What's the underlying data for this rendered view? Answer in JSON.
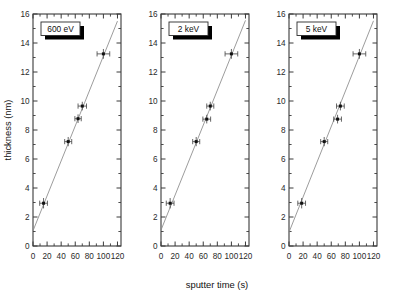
{
  "figure": {
    "xlabel": "sputter time (s)",
    "ylabel": "thickness (nm)",
    "background": "#ffffff",
    "line_color": "#8a8a8a",
    "marker_color": "#111111",
    "axis_color": "#3a3a3a"
  },
  "chart_data": {
    "type": "scatter",
    "title": "",
    "xlabel": "sputter time (s)",
    "ylabel": "thickness (nm)",
    "xlim": [
      0,
      125
    ],
    "ylim": [
      0,
      16
    ],
    "xticks": [
      0,
      20,
      40,
      60,
      80,
      100,
      120
    ],
    "yticks": [
      0,
      2,
      4,
      6,
      8,
      10,
      12,
      14,
      16
    ],
    "xtick_labels": [
      "0",
      "20",
      "40",
      "60",
      "80",
      "100",
      "120"
    ],
    "ytick_labels": [
      "0",
      "2",
      "4",
      "6",
      "8",
      "10",
      "12",
      "14",
      "16"
    ],
    "grid": false,
    "legend": "none",
    "panels": [
      {
        "label": "600 eV",
        "x": [
          15,
          50,
          64,
          70,
          100
        ],
        "y": [
          2.95,
          7.2,
          8.78,
          9.65,
          13.25
        ],
        "xerr": [
          5.5,
          5.0,
          4.5,
          6.0,
          9.0
        ],
        "yerr": [
          0.22,
          0.18,
          0.16,
          0.16,
          0.2
        ],
        "fit": {
          "intercept": 1.05,
          "slope": 0.1205,
          "x_start": 0,
          "x_end": 120
        }
      },
      {
        "label": "2 keV",
        "x": [
          13,
          50,
          65,
          70,
          100
        ],
        "y": [
          2.95,
          7.2,
          8.75,
          9.65,
          13.25
        ],
        "xerr": [
          5.5,
          5.0,
          5.5,
          5.0,
          9.0
        ],
        "yerr": [
          0.22,
          0.18,
          0.16,
          0.16,
          0.2
        ],
        "fit": {
          "intercept": 1.1,
          "slope": 0.1205,
          "x_start": 0,
          "x_end": 120
        }
      },
      {
        "label": "5 keV",
        "x": [
          18,
          50,
          69,
          73,
          100
        ],
        "y": [
          2.95,
          7.2,
          8.75,
          9.65,
          13.25
        ],
        "xerr": [
          5.5,
          5.0,
          5.5,
          5.5,
          9.0
        ],
        "yerr": [
          0.22,
          0.18,
          0.16,
          0.16,
          0.2
        ],
        "fit": {
          "intercept": 0.95,
          "slope": 0.1215,
          "x_start": 0,
          "x_end": 120
        }
      }
    ]
  }
}
